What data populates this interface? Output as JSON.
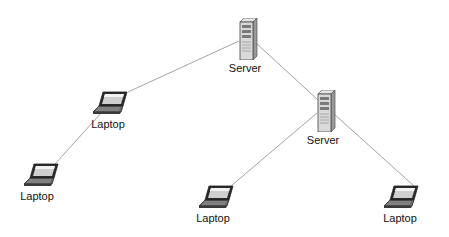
{
  "diagram": {
    "type": "network-topology",
    "colors": {
      "background": "#ffffff",
      "link": "#8a8a8a",
      "label": "#111111"
    },
    "nodes": [
      {
        "id": "server-1",
        "kind": "server",
        "icon": "server-tower-icon",
        "label": "Server",
        "x": 238,
        "y": 18,
        "label_x": 245,
        "label_y": 62
      },
      {
        "id": "server-2",
        "kind": "server",
        "icon": "server-tower-icon",
        "label": "Server",
        "x": 316,
        "y": 90,
        "label_x": 323,
        "label_y": 134
      },
      {
        "id": "laptop-1",
        "kind": "laptop",
        "icon": "laptop-icon",
        "label": "Laptop",
        "x": 93,
        "y": 90,
        "label_x": 108,
        "label_y": 118
      },
      {
        "id": "laptop-2",
        "kind": "laptop",
        "icon": "laptop-icon",
        "label": "Laptop",
        "x": 24,
        "y": 162,
        "label_x": 37,
        "label_y": 190
      },
      {
        "id": "laptop-3",
        "kind": "laptop",
        "icon": "laptop-icon",
        "label": "Laptop",
        "x": 199,
        "y": 184,
        "label_x": 213,
        "label_y": 212
      },
      {
        "id": "laptop-4",
        "kind": "laptop",
        "icon": "laptop-icon",
        "label": "Laptop",
        "x": 384,
        "y": 184,
        "label_x": 400,
        "label_y": 212
      }
    ],
    "links": [
      {
        "from": "server-1",
        "to": "laptop-1",
        "x1": 239,
        "y1": 41,
        "x2": 128,
        "y2": 92
      },
      {
        "from": "server-1",
        "to": "server-2",
        "x1": 256,
        "y1": 43,
        "x2": 318,
        "y2": 100
      },
      {
        "from": "laptop-1",
        "to": "laptop-2",
        "x1": 102,
        "y1": 112,
        "x2": 55,
        "y2": 164
      },
      {
        "from": "server-2",
        "to": "laptop-3",
        "x1": 317,
        "y1": 113,
        "x2": 231,
        "y2": 186
      },
      {
        "from": "server-2",
        "to": "laptop-4",
        "x1": 333,
        "y1": 113,
        "x2": 414,
        "y2": 186
      }
    ]
  }
}
